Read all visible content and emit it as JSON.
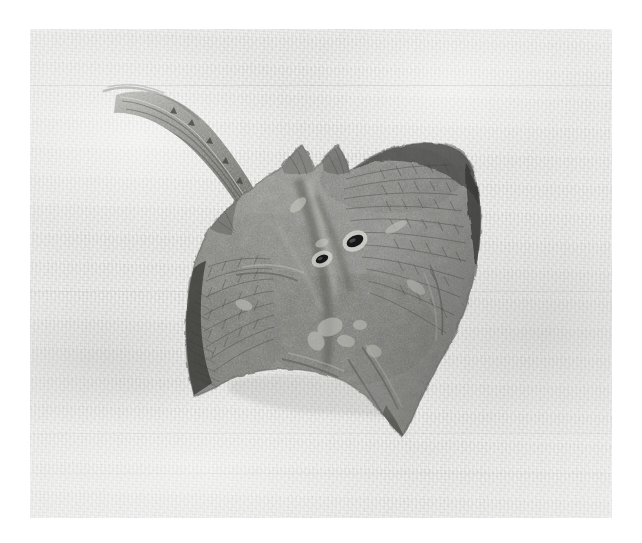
{
  "image": {
    "kind": "photograph",
    "subject": "skate-ray-specimen",
    "orientation": "dorsal view, tail toward upper left, snout toward lower right",
    "medium": "grayscale photographic print on textured paper",
    "caption": "",
    "width_px": 642,
    "height_px": 543
  },
  "canvas": {
    "background_color": "#ffffff",
    "border_margin_px": 30
  },
  "paper": {
    "label": "textured paper background",
    "base_color": "#e9e9e7",
    "highlight_color": "#f6f6f5",
    "shadow_color": "#c9c9c6",
    "left_px": 30,
    "top_px": 29,
    "width_px": 582,
    "height_px": 489
  },
  "specimen": {
    "label": "skate (ray) specimen",
    "body_color": "#8e8e8b",
    "body_dark_color": "#5e5e5c",
    "body_light_color": "#b4b4b0",
    "edge_dark_color": "#2e2e2d",
    "eye_color": "#17171a",
    "highlight_color": "#e4e4e0",
    "parts": [
      {
        "name": "tail",
        "note": "slender, curving up and to the left, fading at the tip"
      },
      {
        "name": "left-pectoral-wing",
        "note": "rounded lobe with radiating fin-ray striations"
      },
      {
        "name": "right-pectoral-wing",
        "note": "broad lobe, dark inked margin at upper right"
      },
      {
        "name": "pelvic-fins",
        "note": "two pointed lobes at the top of the disc"
      },
      {
        "name": "rostrum-snout",
        "note": "pointed tip at the lower right of the disc"
      },
      {
        "name": "eye",
        "note": "dark oval opening, upper of the pair"
      },
      {
        "name": "spiracle",
        "note": "dark oval opening, lower of the pair"
      }
    ]
  }
}
